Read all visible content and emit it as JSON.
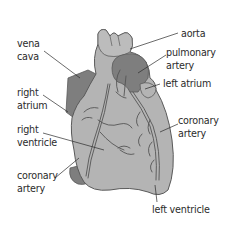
{
  "diagram": {
    "colors": {
      "heart_body": "#b4b4b4",
      "heart_outline": "#5a5a5a",
      "dark_vessel": "#7e7e7e",
      "vessel_line": "#555555",
      "label_text": "#2b2b2b",
      "leader_line": "#2b2b2b"
    },
    "labels": {
      "vena_cava": {
        "line1": "vena",
        "line2": "cava"
      },
      "right_atrium": {
        "line1": "right",
        "line2": "atrium"
      },
      "right_ventricle": {
        "line1": "right",
        "line2": "ventricle"
      },
      "coronary_artery_left": {
        "line1": "coronary",
        "line2": "artery"
      },
      "aorta": {
        "line1": "aorta"
      },
      "pulmonary_artery": {
        "line1": "pulmonary",
        "line2": "artery"
      },
      "left_atrium": {
        "line1": "left atrium"
      },
      "coronary_artery_right": {
        "line1": "coronary",
        "line2": "artery"
      },
      "left_ventricle": {
        "line1": "left ventricle"
      }
    }
  }
}
